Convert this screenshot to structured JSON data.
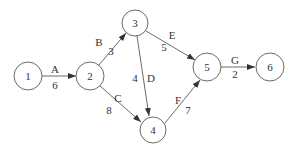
{
  "diagram": {
    "type": "activity-on-arrow network",
    "nodes": [
      {
        "id": "1",
        "label": "1",
        "x": 28,
        "y": 76
      },
      {
        "id": "2",
        "label": "2",
        "x": 90,
        "y": 76
      },
      {
        "id": "3",
        "label": "3",
        "x": 135,
        "y": 23
      },
      {
        "id": "4",
        "label": "4",
        "x": 153,
        "y": 130
      },
      {
        "id": "5",
        "label": "5",
        "x": 207,
        "y": 67
      },
      {
        "id": "6",
        "label": "6",
        "x": 270,
        "y": 67
      }
    ],
    "edges": [
      {
        "from": "1",
        "to": "2",
        "activity": "A",
        "duration": "6"
      },
      {
        "from": "2",
        "to": "3",
        "activity": "B",
        "duration": "3"
      },
      {
        "from": "2",
        "to": "4",
        "activity": "C",
        "duration": "8"
      },
      {
        "from": "3",
        "to": "4",
        "activity": "D",
        "duration": "4"
      },
      {
        "from": "3",
        "to": "5",
        "activity": "E",
        "duration": "5"
      },
      {
        "from": "4",
        "to": "5",
        "activity": "F",
        "duration": "7"
      },
      {
        "from": "5",
        "to": "6",
        "activity": "G",
        "duration": "2"
      }
    ]
  }
}
